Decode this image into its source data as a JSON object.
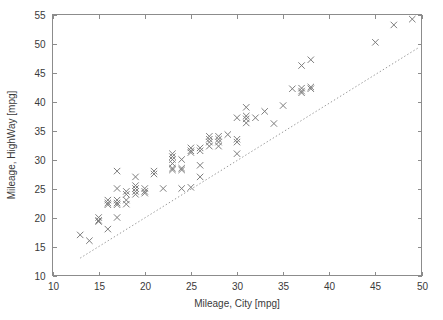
{
  "chart_data": {
    "type": "scatter",
    "title": "",
    "xlabel": "Mileage, City [mpg]",
    "ylabel": "Mileage, HighWay [mpg]",
    "xlim": [
      10,
      50
    ],
    "ylim": [
      10,
      55
    ],
    "xticks": [
      10,
      15,
      20,
      25,
      30,
      35,
      40,
      45,
      50
    ],
    "yticks": [
      10,
      15,
      20,
      25,
      30,
      35,
      40,
      45,
      50,
      55
    ],
    "xtick_labels": [
      "10",
      "15",
      "20",
      "25",
      "30",
      "35",
      "40",
      "45",
      "50"
    ],
    "ytick_labels": [
      "10",
      "15",
      "20",
      "25",
      "30",
      "35",
      "40",
      "45",
      "50",
      "55"
    ],
    "grid": false,
    "legend": null,
    "marker": "x",
    "marker_color": "#7d7d7d",
    "series": [
      {
        "name": "Vehicles",
        "marker": "x",
        "points": [
          [
            13,
            17
          ],
          [
            14,
            16
          ],
          [
            15,
            20
          ],
          [
            15,
            19.5
          ],
          [
            15,
            19.3
          ],
          [
            16,
            23
          ],
          [
            16,
            22.5
          ],
          [
            16,
            22.2
          ],
          [
            16,
            18
          ],
          [
            17,
            28
          ],
          [
            17,
            25
          ],
          [
            17,
            23
          ],
          [
            17,
            22.5
          ],
          [
            17,
            22.2
          ],
          [
            17,
            20
          ],
          [
            18,
            24.5
          ],
          [
            18,
            24
          ],
          [
            18,
            23
          ],
          [
            18,
            22.3
          ],
          [
            19,
            27
          ],
          [
            19,
            25.5
          ],
          [
            19,
            25
          ],
          [
            19,
            24.5
          ],
          [
            19,
            24
          ],
          [
            20,
            25
          ],
          [
            20,
            24.5
          ],
          [
            20,
            24.2
          ],
          [
            21,
            28
          ],
          [
            21,
            27.5
          ],
          [
            22,
            25
          ],
          [
            23,
            31
          ],
          [
            23,
            30.5
          ],
          [
            23,
            30
          ],
          [
            23,
            29.3
          ],
          [
            23,
            28.5
          ],
          [
            23,
            28.2
          ],
          [
            24,
            30
          ],
          [
            24,
            28.5
          ],
          [
            24,
            28.2
          ],
          [
            24,
            25
          ],
          [
            25,
            32
          ],
          [
            25,
            31.5
          ],
          [
            25,
            31.2
          ],
          [
            25,
            25.2
          ],
          [
            26,
            32
          ],
          [
            26,
            31.5
          ],
          [
            26,
            29
          ],
          [
            26,
            27
          ],
          [
            27,
            34
          ],
          [
            27,
            33.5
          ],
          [
            27,
            33
          ],
          [
            27,
            32.3
          ],
          [
            28,
            34
          ],
          [
            28,
            33.5
          ],
          [
            28,
            33
          ],
          [
            28,
            32.3
          ],
          [
            29,
            34.3
          ],
          [
            30,
            37.2
          ],
          [
            30,
            33.5
          ],
          [
            30,
            33
          ],
          [
            30,
            31
          ],
          [
            31,
            39
          ],
          [
            31,
            37.5
          ],
          [
            31,
            37
          ],
          [
            31,
            36.3
          ],
          [
            32,
            37.2
          ],
          [
            33,
            38.3
          ],
          [
            34,
            36.2
          ],
          [
            35,
            39.3
          ],
          [
            36,
            42.2
          ],
          [
            37,
            46.2
          ],
          [
            37,
            42.3
          ],
          [
            37,
            41.8
          ],
          [
            37,
            41.5
          ],
          [
            38,
            47.2
          ],
          [
            38,
            42.5
          ],
          [
            38,
            42.2
          ],
          [
            45,
            50.2
          ],
          [
            47,
            53.2
          ],
          [
            49,
            54.2
          ]
        ]
      }
    ],
    "reference_line": {
      "type": "dotted",
      "description": "identity line y = x",
      "x_start": 13,
      "y_start": 13,
      "x_end": 49.7,
      "y_end": 49.3
    }
  }
}
